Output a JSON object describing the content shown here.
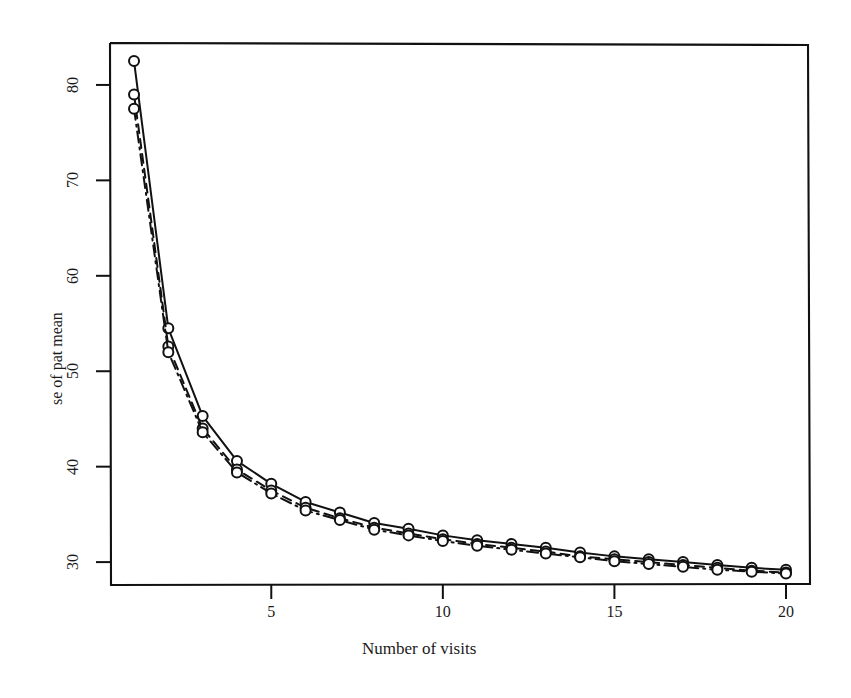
{
  "figure": {
    "background_color": "#ffffff",
    "ink_color": "#111111",
    "width": 851,
    "height": 698
  },
  "axes": {
    "x_label": "Number of visits",
    "y_label": "se of pat mean",
    "x_ticks": [
      "5",
      "10",
      "15",
      "20"
    ],
    "y_ticks": [
      "30",
      "40",
      "50",
      "60",
      "70",
      "80"
    ]
  },
  "chart_data": {
    "type": "line",
    "title": "",
    "subtitle": "",
    "xlabel": "Number of visits",
    "ylabel": "se of pat mean",
    "xlim": [
      0.3,
      20.7
    ],
    "ylim": [
      27.6,
      84.5
    ],
    "xticks": [
      5,
      10,
      15,
      20
    ],
    "yticks": [
      30,
      40,
      50,
      60,
      70,
      80
    ],
    "grid": false,
    "legend": "none",
    "marker": "open-circle",
    "x": [
      1,
      2,
      3,
      4,
      5,
      6,
      7,
      8,
      9,
      10,
      11,
      12,
      13,
      14,
      15,
      16,
      17,
      18,
      19,
      20
    ],
    "series": [
      {
        "name": "series-1",
        "linestyle": "solid",
        "values": [
          82.5,
          54.5,
          45.3,
          40.6,
          38.2,
          36.3,
          35.2,
          34.1,
          33.5,
          32.8,
          32.3,
          31.9,
          31.5,
          31.0,
          30.6,
          30.3,
          30.0,
          29.7,
          29.4,
          29.2
        ]
      },
      {
        "name": "series-2",
        "linestyle": "dashed",
        "values": [
          79.0,
          52.6,
          44.0,
          39.7,
          37.5,
          35.7,
          34.6,
          33.6,
          33.0,
          32.4,
          31.9,
          31.5,
          31.1,
          30.6,
          30.3,
          30.0,
          29.7,
          29.4,
          29.1,
          28.9
        ]
      },
      {
        "name": "series-3",
        "linestyle": "dotdash",
        "values": [
          77.5,
          52.0,
          43.6,
          39.4,
          37.2,
          35.4,
          34.4,
          33.4,
          32.8,
          32.2,
          31.7,
          31.3,
          30.9,
          30.5,
          30.1,
          29.8,
          29.5,
          29.2,
          29.0,
          28.8
        ]
      }
    ]
  }
}
